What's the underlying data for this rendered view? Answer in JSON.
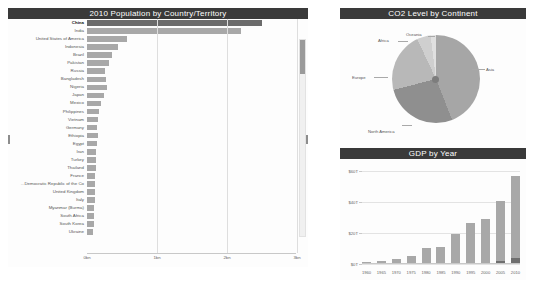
{
  "population_panel": {
    "title": "2010 Population by Country/Territory",
    "scrollbar_name": "vertical-scrollbar"
  },
  "pie_panel": {
    "title": "CO2 Level by Continent"
  },
  "gdp_panel": {
    "title": "GDP by Year"
  },
  "chart_data": [
    {
      "type": "bar",
      "orientation": "horizontal",
      "title": "2010 Population by Country/Territory",
      "xlabel": "",
      "ylabel": "",
      "xlim": [
        0,
        1500000000
      ],
      "grid": true,
      "xticks": [
        "0bn",
        "1bn",
        "2bn",
        "3bn"
      ],
      "xtick_values": [
        0,
        1000000000,
        2000000000,
        3000000000
      ],
      "categories": [
        "China",
        "India",
        "United States of America",
        "Indonesia",
        "Brazil",
        "Pakistan",
        "Russia",
        "Bangladesh",
        "Nigeria",
        "Japan",
        "Mexico",
        "Philippines",
        "Vietnam",
        "Germany",
        "Ethiopia",
        "Egypt",
        "Iran",
        "Turkey",
        "Thailand",
        "France",
        "Democratic Republic of the Co...",
        "United Kingdom",
        "Italy",
        "Myanmar (Burma)",
        "South Africa",
        "South Korea",
        "Ukraine"
      ],
      "values": [
        1340968737,
        1205624648,
        309347057,
        240676485,
        195210154,
        170043918,
        143158099,
        151616777,
        159424742,
        128070000,
        114092963,
        93444322,
        87967651,
        81776930,
        87561752,
        81121077,
        74462314,
        72310000,
        66402316,
        64612939,
        64565000,
        62766365,
        60340328,
        51931231,
        51621000,
        49410366,
        45870700
      ],
      "bar_widths_px": [
        175,
        154,
        40,
        31,
        25,
        22,
        18,
        19,
        20,
        17,
        14,
        12,
        11,
        10,
        11,
        10,
        9,
        9,
        9,
        8,
        8,
        8,
        8,
        7,
        7,
        7,
        6
      ],
      "highlighted_category": "China"
    },
    {
      "type": "pie",
      "title": "CO2 Level by Continent",
      "labels": [
        "Asia",
        "North America",
        "Europe",
        "Africa",
        "Oceania"
      ],
      "values": [
        44,
        27,
        22,
        5,
        2
      ],
      "legend_position": "callout-labels"
    },
    {
      "type": "bar",
      "title": "GDP by Year",
      "xlabel": "",
      "ylabel": "",
      "ylim": [
        0,
        70
      ],
      "yticks": [
        "$0T",
        "$20T",
        "$40T",
        "$60T"
      ],
      "grid": true,
      "categories": [
        "1960",
        "1965",
        "1970",
        "1975",
        "1980",
        "1985",
        "1990",
        "1995",
        "2000",
        "2005",
        "2010"
      ],
      "values": [
        1.4,
        2.0,
        3.4,
        6.4,
        11.8,
        12.9,
        22.6,
        30.9,
        33.6,
        47.4,
        65.9
      ],
      "secondary_values": [
        0,
        0,
        0,
        0,
        0,
        0,
        0,
        0,
        1.0,
        2.4,
        4.5
      ]
    }
  ]
}
